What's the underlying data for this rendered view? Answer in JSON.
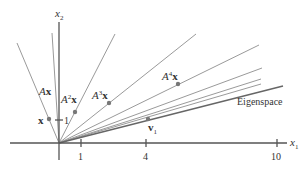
{
  "figure": {
    "axes": {
      "x_label": "x",
      "x_sub": "1",
      "y_label": "x",
      "y_sub": "2",
      "x_ticks": [
        "1",
        "4",
        "10"
      ],
      "y_ticks": [
        "1"
      ]
    },
    "labels": {
      "x": "x",
      "Ax_A": "A",
      "Ax_x": "x",
      "A2x_A": "A",
      "A2x_sup": "2",
      "A2x_x": "x",
      "A3x_A": "A",
      "A3x_sup": "3",
      "A3x_x": "x",
      "A4x_A": "A",
      "A4x_sup": "4",
      "A4x_x": "x",
      "v1_v": "v",
      "v1_sub": "1",
      "eigenspace": "Eigenspace"
    },
    "colors": {
      "line": "#9a9a9a",
      "axis": "#555555",
      "point": "#777777",
      "text": "#333333",
      "eigenspace": "#666666"
    }
  }
}
